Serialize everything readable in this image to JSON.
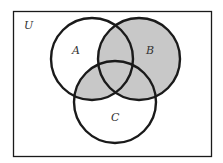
{
  "diagram": {
    "type": "venn",
    "universe_label": "U",
    "sets": [
      {
        "id": "A",
        "label": "A"
      },
      {
        "id": "B",
        "label": "B"
      },
      {
        "id": "C",
        "label": "C"
      }
    ],
    "shaded_region": "B ∪ (A ∩ C)",
    "colors": {
      "shade": "#c8c8c8",
      "stroke": "#1a1a1a",
      "background": "#ffffff"
    }
  }
}
